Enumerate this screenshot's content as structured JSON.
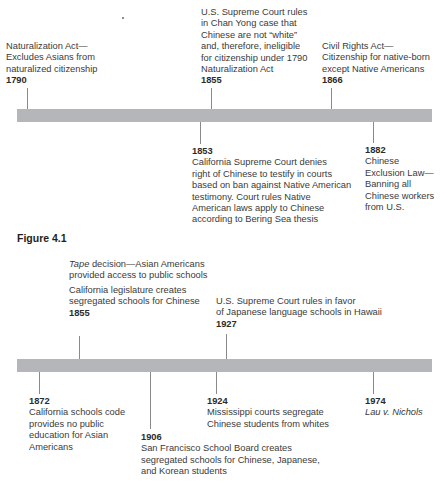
{
  "figure_caption": "Figure 4.1",
  "timeline1": {
    "events_above": [
      {
        "year": "1790",
        "lines": [
          "Naturalization Act—",
          "Excludes Asians from",
          "naturalized citizenship"
        ]
      },
      {
        "year": "1855",
        "lines": [
          "U.S. Supreme Court rules",
          "in Chan Yong case that",
          "Chinese are not “white”",
          "and, therefore, ineligible",
          "for citizenship under 1790",
          "Naturalization Act"
        ]
      },
      {
        "year": "1866",
        "lines": [
          "Civil Rights Act—",
          "Citizenship for native-born",
          "except Native Americans"
        ]
      }
    ],
    "events_below": [
      {
        "year": "1853",
        "lines": [
          "California Supreme Court denies",
          "right of Chinese to testify in courts",
          "based on ban against Native American",
          "testimony. Court rules Native",
          "American laws apply to Chinese",
          "according to Bering Sea thesis"
        ]
      },
      {
        "year": "1882",
        "lines": [
          "Chinese",
          "Exclusion Law—",
          "Banning all",
          "Chinese workers",
          "from U.S."
        ]
      }
    ]
  },
  "timeline2": {
    "events_above": [
      {
        "italic_prefix": "Tape",
        "lines": [
          " decision—Asian Americans",
          "provided access to public schools"
        ]
      },
      {
        "year": "1855",
        "lines": [
          "California legislature creates",
          "segregated schools for Chinese"
        ]
      },
      {
        "year": "1927",
        "lines": [
          "U.S. Supreme Court rules in favor",
          "of Japanese language schools in Hawaii"
        ]
      }
    ],
    "events_below": [
      {
        "year": "1872",
        "lines": [
          "California schools code",
          "provides no public",
          "education for Asian",
          "Americans"
        ]
      },
      {
        "year": "1906",
        "lines": [
          "San Francisco School Board creates",
          "segregated schools for Chinese, Japanese,",
          "and Korean students"
        ]
      },
      {
        "year": "1924",
        "lines": [
          "Mississippi courts segregate",
          "Chinese students from whites"
        ]
      },
      {
        "year": "1974",
        "italic_lines": [
          "Lau v. Nichols"
        ]
      }
    ]
  },
  "colors": {
    "bar": "#b4b6ba",
    "tick": "#8a8a8a",
    "text": "#3a3a3a"
  }
}
